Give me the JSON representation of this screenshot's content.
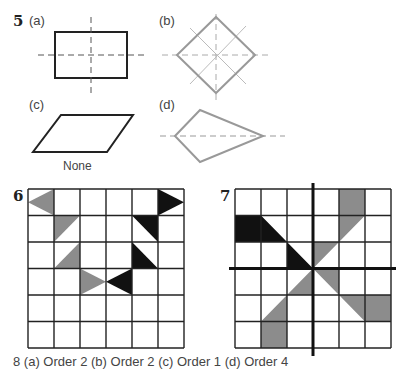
{
  "question5": {
    "number": "5",
    "parts": [
      {
        "label": "(a)",
        "shape": "rectangle",
        "lines_of_symmetry": 2
      },
      {
        "label": "(b)",
        "shape": "square (rotated 45°)",
        "lines_of_symmetry": 4
      },
      {
        "label": "(c)",
        "shape": "parallelogram",
        "caption": "None"
      },
      {
        "label": "(d)",
        "shape": "kite",
        "lines_of_symmetry": 1
      }
    ]
  },
  "question6": {
    "number": "6",
    "grid": {
      "rows": 6,
      "cols": 6
    },
    "shaded_gray": 4,
    "shaded_black": 4
  },
  "question7": {
    "number": "7",
    "grid": {
      "rows": 6,
      "cols": 6
    },
    "axes": "horizontal and vertical through centre"
  },
  "colors": {
    "black_shading": "#111111",
    "gray_shading": "#8c8c8c",
    "outline_gray": "#9a9a9a",
    "grid_line": "#222222"
  },
  "footer": {
    "text": "8 (a) Order 2  (b) Order 2  (c) Order 1  (d) Order 4"
  }
}
